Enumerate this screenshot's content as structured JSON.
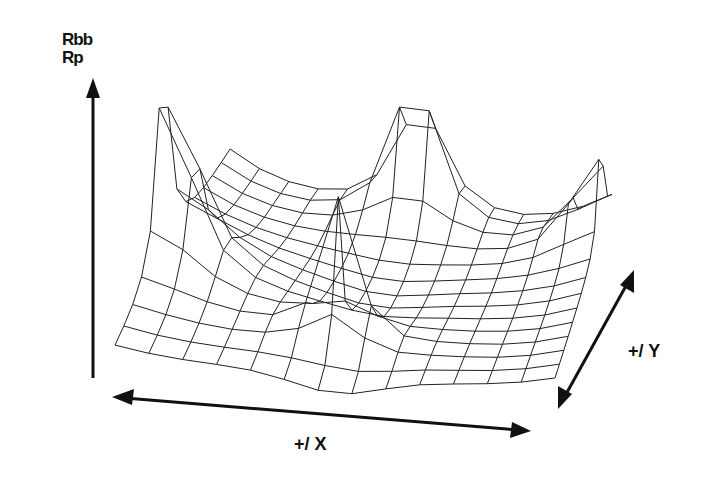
{
  "chart_data": {
    "type": "surface",
    "title": "",
    "zlabel_lines": [
      "Rbb",
      "Rp"
    ],
    "xlabel": "+/ X",
    "ylabel": "+/ Y",
    "grid": {
      "nx": 14,
      "ny": 14
    },
    "peaks": [
      {
        "name": "left-peak",
        "u": 0.0,
        "v": 0.0,
        "height": 1.0
      },
      {
        "name": "back-peak",
        "u": 0.0,
        "v": 1.0,
        "height": 1.0
      },
      {
        "name": "front-peak",
        "u": 1.0,
        "v": 0.0,
        "height": 1.0
      },
      {
        "name": "right-peak",
        "u": 1.0,
        "v": 1.0,
        "height": 1.0
      }
    ],
    "zlim": [
      0,
      1
    ],
    "grid_visible": false,
    "legend": null
  },
  "labels": {
    "z_top": "Rbb",
    "z_bottom": "Rp",
    "x_axis": "+/ X",
    "y_axis": "+/ Y"
  },
  "colors": {
    "line": "#222222",
    "background": "#ffffff"
  }
}
